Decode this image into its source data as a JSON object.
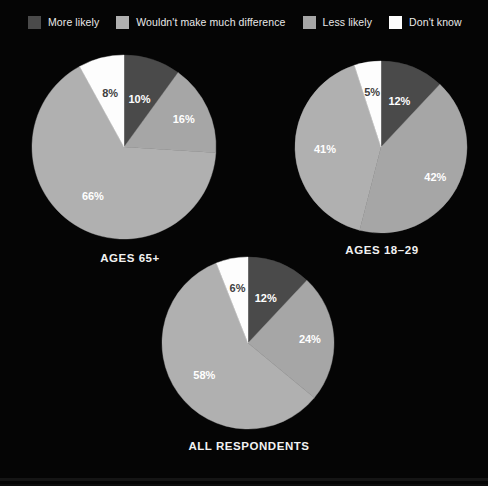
{
  "legend": {
    "items": [
      {
        "label": "More likely",
        "color": "#4a4a4a"
      },
      {
        "label": "Wouldn't make much difference",
        "color": "#b0b0b0"
      },
      {
        "label": "Less likely",
        "color": "#a6a6a6"
      },
      {
        "label": "Don't know",
        "color": "#fdfdfd"
      }
    ]
  },
  "chart_data": [
    {
      "type": "pie",
      "title": "AGES 65+",
      "categories": [
        "More likely",
        "Less likely",
        "Wouldn't make much difference",
        "Don't know"
      ],
      "values": [
        10,
        16,
        66,
        8
      ],
      "labels": [
        "10%",
        "16%",
        "66%",
        "8%"
      ],
      "colors": [
        "#4a4a4a",
        "#a6a6a6",
        "#b0b0b0",
        "#fdfdfd"
      ],
      "start_angle_deg": 0,
      "direction": "clockwise",
      "legend_position": "top"
    },
    {
      "type": "pie",
      "title": "AGES 18–29",
      "categories": [
        "More likely",
        "Less likely",
        "Wouldn't make much difference",
        "Don't know"
      ],
      "values": [
        12,
        42,
        41,
        5
      ],
      "labels": [
        "12%",
        "42%",
        "41%",
        "5%"
      ],
      "colors": [
        "#4a4a4a",
        "#a6a6a6",
        "#b0b0b0",
        "#fdfdfd"
      ],
      "start_angle_deg": 0,
      "direction": "clockwise",
      "legend_position": "top"
    },
    {
      "type": "pie",
      "title": "ALL RESPONDENTS",
      "categories": [
        "More likely",
        "Less likely",
        "Wouldn't make much difference",
        "Don't know"
      ],
      "values": [
        12,
        24,
        58,
        6
      ],
      "labels": [
        "12%",
        "24%",
        "58%",
        "6%"
      ],
      "colors": [
        "#4a4a4a",
        "#a6a6a6",
        "#b0b0b0",
        "#fdfdfd"
      ],
      "start_angle_deg": 0,
      "direction": "clockwise",
      "legend_position": "top"
    }
  ],
  "theme": {
    "background": "#050505",
    "text": "#f2f2f2"
  }
}
